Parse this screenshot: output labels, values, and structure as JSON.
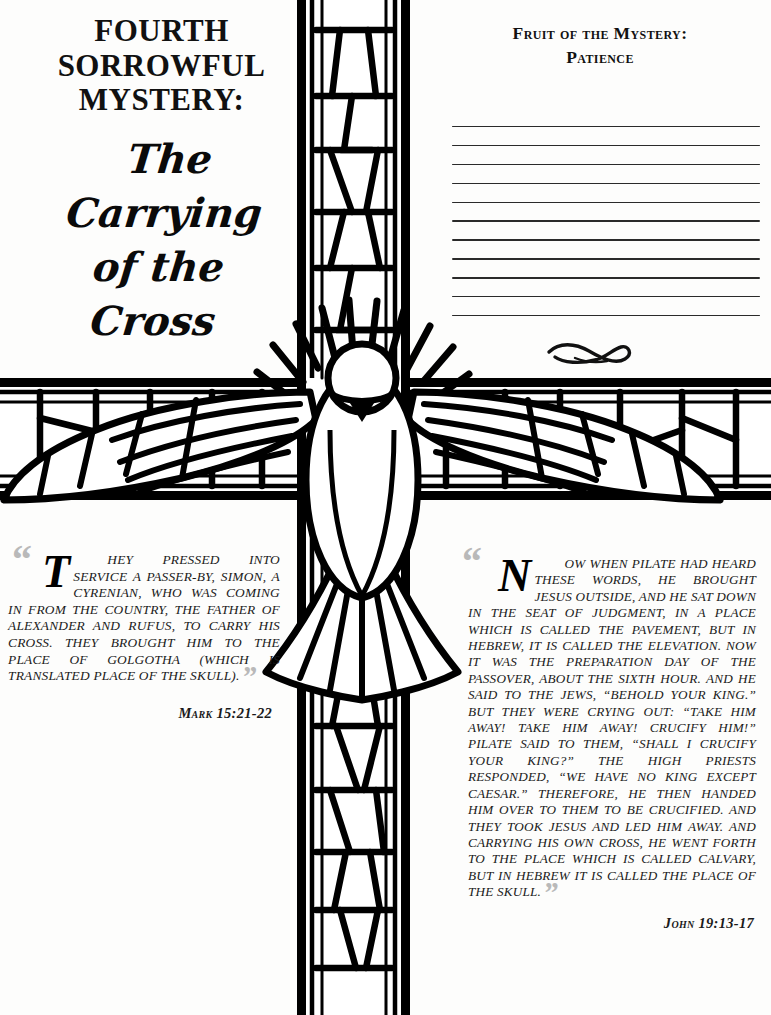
{
  "page": {
    "type": "devotional-coloring-page",
    "background_color": "#fdfdfc",
    "ink_color": "#111111"
  },
  "title": {
    "line1": "FOURTH",
    "line2": "SORROWFUL",
    "line3": "MYSTERY:",
    "script_line1": "The Carrying",
    "script_line2": "of the Cross"
  },
  "fruit": {
    "heading_line1": "Fruit of the Mystery:",
    "heading_line2": "Patience",
    "writing_line_count": 11,
    "ornament": "calligraphic-swash-flourish"
  },
  "artwork": {
    "name": "stained-glass-cross-with-descending-dove",
    "elements": [
      "latin-cross",
      "mosaic-leading",
      "dove",
      "outstretched-wings",
      "fanned-tail"
    ],
    "line_color": "#000000",
    "fill_color": "#ffffff"
  },
  "quotes": [
    {
      "id": "left",
      "dropcap": "T",
      "text": "HEY PRESSED INTO SERVICE A PASSER-BY, SIMON, A CYRENIAN, WHO WAS COMING IN FROM THE COUNTRY, THE FATHER OF ALEXANDER AND RUFUS, TO CARRY HIS CROSS. THEY BROUGHT HIM TO THE PLACE OF GOLGOTHA (WHICH IS TRANSLATED PLACE OF THE SKULL).",
      "citation": "Mark 15:21-22"
    },
    {
      "id": "right",
      "dropcap": "N",
      "text": "OW WHEN PILATE HAD HEARD THESE WORDS, HE BROUGHT JESUS OUTSIDE, AND HE SAT DOWN IN THE SEAT OF JUDGMENT, IN A PLACE WHICH IS CALLED THE PAVEMENT, BUT IN HEBREW, IT IS CALLED THE ELEVATION. NOW IT WAS THE PREPARATION DAY OF THE PASSOVER, ABOUT THE SIXTH HOUR. AND HE SAID TO THE JEWS, “BEHOLD YOUR KING.” BUT THEY WERE CRYING OUT: “TAKE HIM AWAY! TAKE HIM AWAY! CRUCIFY HIM!” PILATE SAID TO THEM, “SHALL I CRUCIFY YOUR KING?” THE HIGH PRIESTS RESPONDED, “WE HAVE NO KING EXCEPT CAESAR.” THEREFORE, HE THEN HANDED HIM OVER TO THEM TO BE CRUCIFIED. AND THEY TOOK JESUS AND LED HIM AWAY. AND CARRYING HIS OWN CROSS, HE WENT FORTH TO THE PLACE WHICH IS CALLED CALVARY, BUT IN HEBREW IT IS CALLED THE PLACE OF THE SKULL.",
      "citation": "John 19:13-17"
    }
  ]
}
